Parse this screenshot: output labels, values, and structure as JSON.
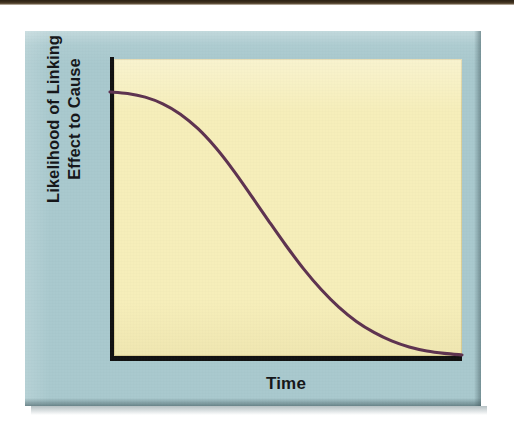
{
  "figure": {
    "background_color": "#ffffff",
    "panel_color": "#a9c9ce",
    "plot_background_color": "#f6eeba",
    "axis_color": "#121212",
    "curve_color": "#5e3350",
    "scan_strip_color": "#2b2114"
  },
  "chart_data": {
    "type": "line",
    "title": "",
    "subtitle": "",
    "xlabel": "Time",
    "ylabel_line1": "Likelihood of Linking",
    "ylabel_line2": "Effect to Cause",
    "ylabel": "Likelihood of Linking Effect to Cause",
    "grid": false,
    "legend": null,
    "xlim": [
      0,
      1
    ],
    "ylim": [
      0,
      1
    ],
    "xtick_labels": [],
    "ytick_labels": [],
    "annotations": [],
    "series": [
      {
        "name": "Likelihood of linking effect to cause over time",
        "color": "#5e3350",
        "shape": "sigmoid-decay",
        "x": [
          0.0,
          0.05,
          0.1,
          0.15,
          0.2,
          0.25,
          0.3,
          0.35,
          0.4,
          0.45,
          0.5,
          0.55,
          0.6,
          0.65,
          0.7,
          0.75,
          0.8,
          0.85,
          0.9,
          0.95,
          1.0
        ],
        "y": [
          0.885,
          0.88,
          0.868,
          0.846,
          0.812,
          0.764,
          0.702,
          0.628,
          0.546,
          0.462,
          0.38,
          0.303,
          0.235,
          0.177,
          0.13,
          0.094,
          0.066,
          0.046,
          0.033,
          0.025,
          0.02
        ]
      }
    ]
  },
  "labels": {
    "x_axis": "Time",
    "y_axis_line1": "Likelihood of Linking",
    "y_axis_line2": "Effect to Cause"
  }
}
